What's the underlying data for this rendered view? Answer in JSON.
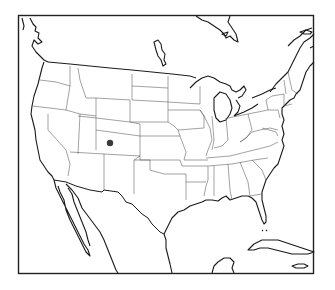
{
  "map": {
    "region": "Contiguous United States",
    "style": "black-and-white outline map with state boundaries",
    "markers": [
      {
        "label": "location-marker",
        "state": "Colorado",
        "x": 110,
        "y": 143,
        "r": 3.2,
        "color": "#3a3a3a"
      }
    ],
    "colors": {
      "outline": "#1a1a1a",
      "state_lines": "#555555",
      "background": "#ffffff"
    }
  }
}
